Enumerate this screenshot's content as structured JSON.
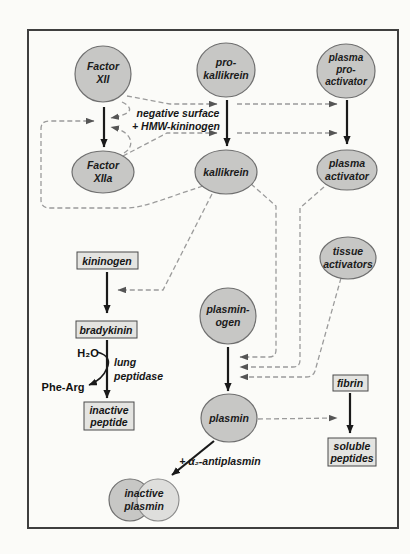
{
  "figure": {
    "nodes": {
      "factor_xii": {
        "lines": [
          "Factor",
          "XII"
        ]
      },
      "pro_kallikrein": {
        "lines": [
          "pro-",
          "kallikrein"
        ]
      },
      "plasma_pro_activator": {
        "lines": [
          "plasma",
          "pro-",
          "activator"
        ]
      },
      "factor_xiia": {
        "lines": [
          "Factor",
          "XIIa"
        ]
      },
      "kallikrein": {
        "lines": [
          "kallikrein"
        ]
      },
      "plasma_activator": {
        "lines": [
          "plasma",
          "activator"
        ]
      },
      "tissue_activators": {
        "lines": [
          "tissue",
          "activators"
        ]
      },
      "plasminogen": {
        "lines": [
          "plasmin-",
          "ogen"
        ]
      },
      "plasmin": {
        "lines": [
          "plasmin"
        ]
      },
      "inactive_plasmin": {
        "lines": [
          "inactive",
          "plasmin"
        ]
      }
    },
    "boxes": {
      "kininogen": {
        "label": "kininogen"
      },
      "bradykinin": {
        "label": "bradykinin"
      },
      "inactive_peptide": {
        "lines": [
          "inactive",
          "peptide"
        ]
      },
      "fibrin": {
        "label": "fibrin"
      },
      "soluble_peptides": {
        "lines": [
          "soluble",
          "peptides"
        ]
      }
    },
    "labels": {
      "cofactor_line1": "negative surface",
      "cofactor_line2": "+ HMW-kininogen",
      "h2o": "H₂O",
      "phe_arg": "Phe-Arg",
      "lung_peptidase_line1": "lung",
      "lung_peptidase_line2": "peptidase",
      "antiplasmin": "+ α₂-antiplasmin"
    },
    "colors": {
      "node_fill": "#c7c7c5",
      "node_fill_light": "#dededc",
      "box_fill": "#e4e4e1",
      "dashed_line": "#9b9b9b",
      "solid_line": "#1a1a1a",
      "frame": "#3f3f3f",
      "background": "#fbfbf8"
    }
  }
}
